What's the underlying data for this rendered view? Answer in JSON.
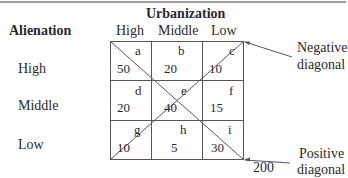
{
  "column_title": "Urbanization",
  "row_title": "Alienation",
  "columns": [
    "High",
    "Middle",
    "Low"
  ],
  "rows": [
    "High",
    "Middle",
    "Low"
  ],
  "cells": [
    [
      {
        "letter": "a",
        "value": "50"
      },
      {
        "letter": "b",
        "value": "20"
      },
      {
        "letter": "c",
        "value": "10"
      }
    ],
    [
      {
        "letter": "d",
        "value": "20"
      },
      {
        "letter": "e",
        "value": "40"
      },
      {
        "letter": "f",
        "value": "15"
      }
    ],
    [
      {
        "letter": "g",
        "value": "10"
      },
      {
        "letter": "h",
        "value": "5"
      },
      {
        "letter": "i",
        "value": "30"
      }
    ]
  ],
  "total": "200",
  "annotations": {
    "negative": {
      "line1": "Negative",
      "line2": "diagonal"
    },
    "positive": {
      "line1": "Positive",
      "line2": "diagonal"
    }
  },
  "colors": {
    "line": "#555555",
    "text": "#2a2a2a",
    "rule": "#9a9a9a"
  }
}
